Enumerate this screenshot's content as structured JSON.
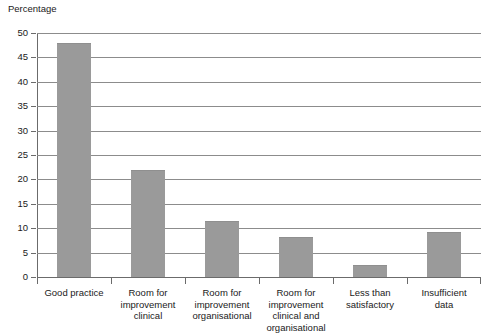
{
  "chart_data": {
    "type": "bar",
    "title": "",
    "ylabel": "Percentage",
    "xlabel": "",
    "ylim": [
      0,
      50
    ],
    "yticks": [
      0,
      5,
      10,
      15,
      20,
      25,
      30,
      35,
      40,
      45,
      50
    ],
    "grid": true,
    "legend": false,
    "bar_color": "#9a9a9a",
    "axis_color": "#6b6b6b",
    "grid_color": "#8c8c8c",
    "categories": [
      "Good practice",
      "Room for improvement clinical",
      "Room for improvement organisational",
      "Room for improvement clinical and organisational",
      "Less than satisfactory",
      "Insufficient data"
    ],
    "category_lines": [
      [
        "Good practice"
      ],
      [
        "Room for",
        "improvement",
        "clinical"
      ],
      [
        "Room for",
        "improvement",
        "organisational"
      ],
      [
        "Room for",
        "improvement",
        "clinical and",
        "organisational"
      ],
      [
        "Less than",
        "satisfactory"
      ],
      [
        "Insufficient",
        "data"
      ]
    ],
    "values": [
      48,
      22,
      11.5,
      8.2,
      2.4,
      9.2
    ]
  }
}
